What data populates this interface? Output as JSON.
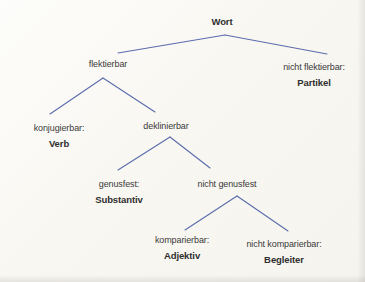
{
  "diagram": {
    "type": "tree",
    "title": "Wort",
    "colors": {
      "line": "#5b6cad",
      "text": "#3a3a3a",
      "page": "#f8f6f1"
    },
    "nodes": {
      "wort": {
        "label": "Wort"
      },
      "flektierbar": {
        "label": "flektierbar"
      },
      "nicht_flektierbar": {
        "label": "nicht flektierbar:",
        "word_class": "Partikel"
      },
      "konjugierbar": {
        "label": "konjugierbar:",
        "word_class": "Verb"
      },
      "deklinierbar": {
        "label": "deklinierbar"
      },
      "genusfest": {
        "label": "genusfest:",
        "word_class": "Substantiv"
      },
      "nicht_genusfest": {
        "label": "nicht genusfest"
      },
      "komparierbar": {
        "label": "komparierbar:",
        "word_class": "Adjektiv"
      },
      "nicht_komparierbar": {
        "label": "nicht komparierbar:",
        "word_class": "Begleiter"
      }
    },
    "edges": [
      [
        "wort",
        "flektierbar"
      ],
      [
        "wort",
        "nicht_flektierbar"
      ],
      [
        "flektierbar",
        "konjugierbar"
      ],
      [
        "flektierbar",
        "deklinierbar"
      ],
      [
        "deklinierbar",
        "genusfest"
      ],
      [
        "deklinierbar",
        "nicht_genusfest"
      ],
      [
        "nicht_genusfest",
        "komparierbar"
      ],
      [
        "nicht_genusfest",
        "nicht_komparierbar"
      ]
    ]
  }
}
